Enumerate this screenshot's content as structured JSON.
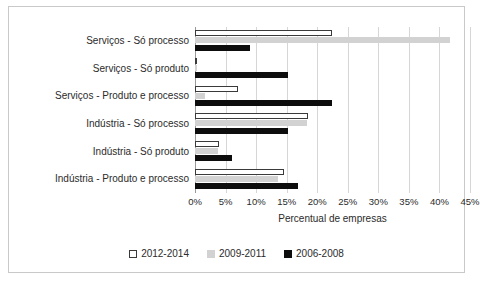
{
  "chart_data": {
    "type": "bar",
    "orientation": "horizontal",
    "title": "",
    "xlabel": "Percentual de empresas",
    "ylabel": "",
    "xlim": [
      0,
      45
    ],
    "xticks": [
      "0%",
      "5%",
      "10%",
      "15%",
      "20%",
      "25%",
      "30%",
      "35%",
      "40%",
      "45%"
    ],
    "xtick_values": [
      0,
      5,
      10,
      15,
      20,
      25,
      30,
      35,
      40,
      45
    ],
    "grid": true,
    "legend_position": "bottom",
    "categories": [
      "Serviços - Só processo",
      "Serviços - Só produto",
      "Serviços - Produto e processo",
      "Indústria - Só processo",
      "Indústria - Só produto",
      "Indústria - Produto e processo"
    ],
    "series": [
      {
        "name": "2012-2014",
        "color": "#ffffff",
        "values": [
          22.4,
          0.4,
          7.0,
          18.5,
          4.0,
          14.5
        ]
      },
      {
        "name": "2009-2011",
        "color": "#d2d2d2",
        "values": [
          41.8,
          0.3,
          1.6,
          18.3,
          3.7,
          13.6
        ]
      },
      {
        "name": "2006-2008",
        "color": "#0d0d0d",
        "values": [
          9.0,
          15.2,
          22.4,
          15.2,
          6.0,
          16.8
        ]
      }
    ]
  },
  "legend": {
    "items": [
      {
        "label": "2012-2014"
      },
      {
        "label": "2009-2011"
      },
      {
        "label": "2006-2008"
      }
    ]
  }
}
